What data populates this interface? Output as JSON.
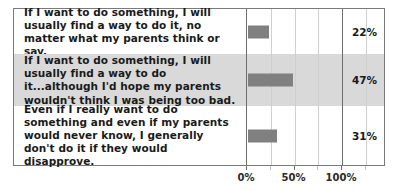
{
  "chart_data": {
    "type": "bar",
    "orientation": "horizontal",
    "title": "",
    "subtitle": "",
    "xlabel": "",
    "ylabel": "",
    "xlim": [
      0,
      125
    ],
    "grid": true,
    "legend": null,
    "categories": [
      "If I want to do something, I will usually find a way to do it, no matter what my parents think or say.",
      "If I want to do something, I will usually find a way to do it...although I'd hope my parents wouldn't think I was being too bad.",
      "Even if I really want to do something and even if my parents would never know, I generally don't do it if they would disapprove."
    ],
    "values": [
      22,
      47,
      31
    ],
    "value_labels": [
      "22%",
      "47%",
      "31%"
    ],
    "tick_values": [
      0,
      50,
      100
    ],
    "tick_labels": [
      "0%",
      "50%",
      "100%"
    ],
    "minor_gridlines": [
      25,
      75,
      125
    ],
    "colors": {
      "bar": "#808080",
      "stripe_row": "#d9d9d9",
      "frame": "#7a7a7a",
      "gridline": "#cfcfcf",
      "axis": "#6e6e6e",
      "text": "#1a1a1a",
      "background": "#ffffff"
    }
  },
  "rows": [
    {
      "statement": "If I want to do something, I will usually find a way to do it, no matter what my parents think or say.",
      "value_label": "22%"
    },
    {
      "statement": "If I want to do something, I will usually find a way to do it...although I'd hope my parents wouldn't think I was being too bad.",
      "value_label": "47%"
    },
    {
      "statement": "Even if I really want to do something and even if my parents would never know, I generally don't do it if they would disapprove.",
      "value_label": "31%"
    }
  ],
  "axis": {
    "tick_labels": [
      "0%",
      "50%",
      "100%"
    ]
  }
}
